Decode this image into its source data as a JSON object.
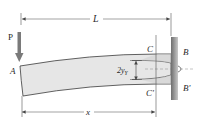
{
  "diagram": {
    "type": "cantilever-beam-plastic-zone",
    "labels": {
      "load": "P",
      "length": "L",
      "free_end": "A",
      "top_fixed": "B",
      "bottom_fixed": "B'",
      "top_yield": "C",
      "bottom_yield": "C'",
      "elastic_core": "2y",
      "elastic_core_sub": "Y",
      "position": "x"
    },
    "colors": {
      "beam_fill": "#e6e6e6",
      "beam_stroke": "#3a3a3a",
      "wall_light": "#c4c4c4",
      "wall_dark": "#6e6e6e",
      "arrow": "#7a7a7a",
      "dimension_line": "#555555",
      "centerline": "#888888"
    }
  }
}
